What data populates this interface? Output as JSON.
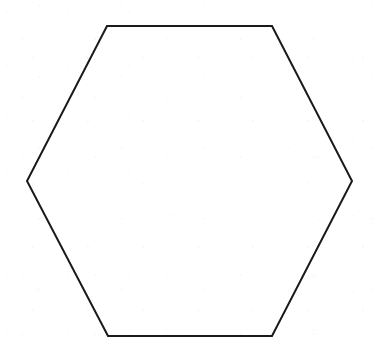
{
  "figure": {
    "canvas": {
      "width": 375,
      "height": 353,
      "background_color": "#ffffff"
    },
    "shape": {
      "name": "hexagon",
      "orientation": "flat-top",
      "sides": 6,
      "fill": "none",
      "stroke_color": "#1a1a1a",
      "stroke_width": 2,
      "points": "107,26 272,26 352,181 272,336 108,336 27,181",
      "vertices": [
        {
          "label": "top-left",
          "x": 107,
          "y": 26
        },
        {
          "label": "top-right",
          "x": 272,
          "y": 26
        },
        {
          "label": "right",
          "x": 352,
          "y": 181
        },
        {
          "label": "bottom-right",
          "x": 272,
          "y": 336
        },
        {
          "label": "bottom-left",
          "x": 108,
          "y": 336
        },
        {
          "label": "left",
          "x": 27,
          "y": 181
        }
      ]
    }
  }
}
